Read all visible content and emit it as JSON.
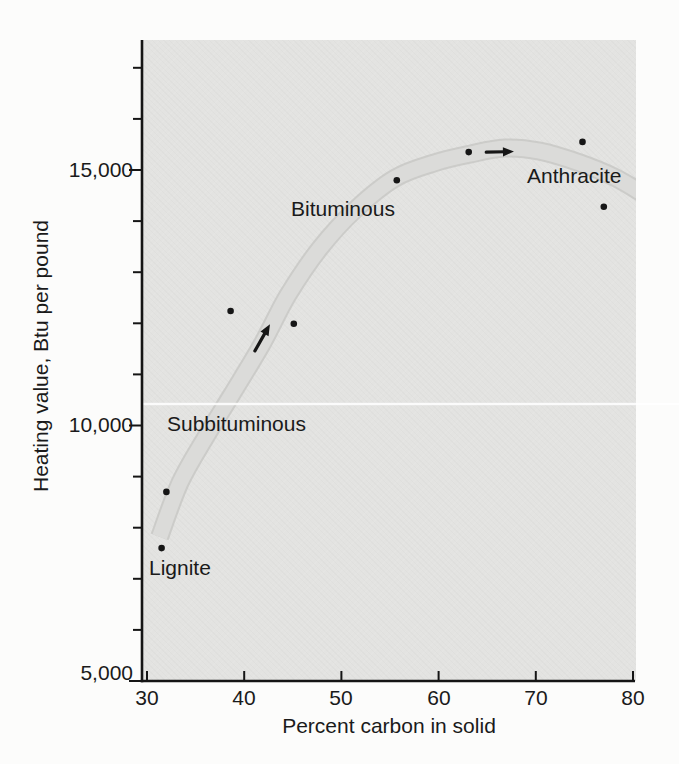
{
  "figure": {
    "page_bg": "#fcfcfb",
    "plot_bg": "#e3e3e1",
    "band_fill": "#dbdbd9",
    "band_edge": "#c5c5c3",
    "dot_color": "#161616",
    "axis_color": "#151515",
    "text_color": "#1a1a1a",
    "artifact_line_color": "#ffffff"
  },
  "chart_data": {
    "type": "scatter",
    "title": "",
    "xlabel": "Percent carbon in solid",
    "ylabel": "Heating value, Btu per pound",
    "xlim": [
      30,
      80
    ],
    "ylim": [
      5000,
      17600
    ],
    "grid": false,
    "legend": null,
    "x_ticks": [
      30,
      40,
      50,
      60,
      70,
      80
    ],
    "x_tick_labels": [
      "30",
      "40",
      "50",
      "60",
      "70",
      "80"
    ],
    "y_major_ticks": [
      5000,
      10000,
      15000
    ],
    "y_major_tick_labels": [
      "5,000",
      "10,000",
      "15,000"
    ],
    "y_minor_ticks": [
      6000,
      7000,
      8000,
      9000,
      11000,
      12000,
      13000,
      14000,
      16000,
      17000
    ],
    "points": [
      [
        31.5,
        7600
      ],
      [
        32.0,
        8700
      ],
      [
        38.6,
        12240
      ],
      [
        45.1,
        11990
      ],
      [
        55.7,
        14800
      ],
      [
        63.1,
        15350
      ],
      [
        74.8,
        15550
      ],
      [
        77.0,
        14280
      ]
    ],
    "band": [
      [
        31.3,
        7820
      ],
      [
        33.4,
        8880
      ],
      [
        36.0,
        9760
      ],
      [
        38.7,
        10600
      ],
      [
        41.8,
        11580
      ],
      [
        44.5,
        12550
      ],
      [
        47.8,
        13470
      ],
      [
        51.4,
        14220
      ],
      [
        55.5,
        14840
      ],
      [
        59.6,
        15140
      ],
      [
        63.2,
        15310
      ],
      [
        66.8,
        15430
      ],
      [
        70.4,
        15370
      ],
      [
        74.5,
        15140
      ],
      [
        78.1,
        14860
      ],
      [
        80.9,
        14550
      ]
    ],
    "band_width_px": 17,
    "arrows": [
      {
        "from": [
          41.1,
          11460
        ],
        "to": [
          42.65,
          11980
        ]
      },
      {
        "from": [
          64.9,
          15350
        ],
        "to": [
          67.75,
          15360
        ]
      }
    ],
    "annotations": [
      {
        "text": "Lignite"
      },
      {
        "text": "Subbituminous"
      },
      {
        "text": "Bituminous"
      },
      {
        "text": "Anthracite"
      }
    ]
  }
}
